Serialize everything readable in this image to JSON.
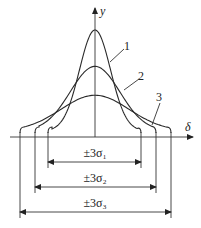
{
  "diagram": {
    "axes": {
      "x_label": "δ",
      "y_label": "y"
    },
    "curves": [
      {
        "id": "1",
        "label": "1",
        "sigma_rel": 1.0,
        "peak_rel": 1.0
      },
      {
        "id": "2",
        "label": "2",
        "sigma_rel": 1.6,
        "peak_rel": 0.66
      },
      {
        "id": "3",
        "label": "3",
        "sigma_rel": 2.2,
        "peak_rel": 0.39
      }
    ],
    "dimensions": [
      {
        "label": "±3σ₁",
        "curve": "1"
      },
      {
        "label": "±3σ₂",
        "curve": "2"
      },
      {
        "label": "±3σ₃",
        "curve": "3"
      }
    ]
  }
}
